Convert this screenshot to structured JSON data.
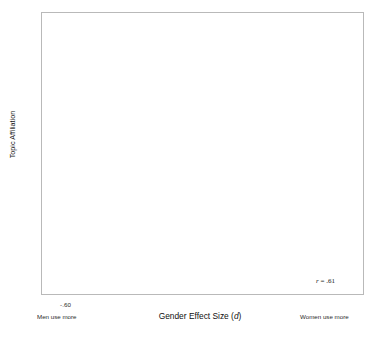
{
  "chart_data": {
    "type": "scatter",
    "title": "",
    "xlabel": "Gender Effect Size (d)",
    "ylabel": "Topic Affiliation",
    "xlim": [
      -0.72,
      0.86
    ],
    "ylim": [
      -0.175,
      0.175
    ],
    "xticks": [
      "-.60",
      "-.40",
      "-.20",
      "0",
      ".20",
      ".40",
      ".60"
    ],
    "xtick_values": [
      -0.6,
      -0.4,
      -0.2,
      0,
      0.2,
      0.4,
      0.6
    ],
    "yticks": [
      ".15",
      ".10",
      ".05",
      "0",
      "-.05",
      "-.10",
      "-.15"
    ],
    "ytick_values": [
      0.15,
      0.1,
      0.05,
      0,
      -0.05,
      -0.1,
      -0.15
    ],
    "grid": false,
    "legend": "none",
    "x_axis_low_label": "Men use more",
    "x_axis_high_label": "Women use more",
    "correlation_label": "r = .61",
    "correlation_value": 0.61,
    "n_points": 800,
    "marker": "open-circle",
    "fit_line": {
      "type": "linear-regression",
      "x_start": -0.47,
      "y_start": -0.052,
      "x_end": 0.68,
      "y_end": 0.069
    },
    "annotations": [
      {
        "id": "family-cluster",
        "lines": [
          "family, friends, wonderful,",
          "blessed, amazing, thankful,",
          "loving, husband, grateful, lucky"
        ],
        "text_x": 218,
        "text_y": 10,
        "leader": [
          [
            300,
            22
          ],
          [
            322,
            31
          ]
        ],
        "point": [
          0.505,
          0.156
        ]
      },
      {
        "id": "congrats-cluster",
        "lines": [
          "great, job, guys,",
          "amazing, crew, awesome,",
          "show, cast, proud, congrats"
        ],
        "text_x": 114,
        "text_y": 30,
        "leader": [
          [
            187,
            48
          ],
          [
            200,
            74
          ]
        ],
        "point": [
          -0.028,
          0.102
        ]
      },
      {
        "id": "sports-cluster",
        "lines": [
          "football, team, season,",
          "game, play, players,",
          "league, sports, fantasy"
        ],
        "text_x": 46,
        "text_y": 99,
        "leader": [
          [
            97,
            116
          ],
          [
            114,
            145
          ]
        ],
        "point": [
          -0.448,
          0.012
        ]
      },
      {
        "id": "politics-cluster",
        "lines": [
          "government,",
          "freedom,",
          "rights, country,",
          "thomas, political"
        ],
        "text_x": 43,
        "text_y": 196,
        "leader": [
          [
            98,
            203
          ],
          [
            122,
            208
          ]
        ],
        "point": [
          -0.404,
          -0.078
        ]
      },
      {
        "id": "profanity-cluster",
        "lines": [
          "shit, holy, fuck,",
          "fucking, piece, bull,",
          "loud, fuckin"
        ],
        "text_x": 62,
        "text_y": 270,
        "leader": [
          [
            96,
            269
          ],
          [
            96,
            245
          ]
        ],
        "point": [
          -0.452,
          -0.11
        ]
      },
      {
        "id": "negative-people-cluster",
        "lines": [
          "people, rude, selfish,",
          "stupid, ignorant, assholes,",
          "arrogant, they're"
        ],
        "text_x": 146,
        "text_y": 271,
        "leader": [
          [
            180,
            269
          ],
          [
            180,
            245
          ]
        ],
        "point": [
          -0.098,
          -0.11
        ]
      },
      {
        "id": "apathy-cluster",
        "lines": [
          "don't, care, anymore,",
          "honestly, pretend, act,",
          "bother, stare, else's, cared"
        ],
        "text_x": 213,
        "text_y": 218,
        "leader": [
          [
            212,
            216
          ],
          [
            199,
            203
          ]
        ],
        "point": [
          0.098,
          -0.05
        ]
      },
      {
        "id": "shopping-cluster",
        "lines": [
          "shopping, christmas, grocery,",
          "clothes, xmas, online,",
          "shoppin, spree, lunch, mall"
        ],
        "text_x": 277,
        "text_y": 186,
        "leader": [
          [
            300,
            184
          ],
          [
            300,
            152
          ]
        ],
        "point": [
          0.476,
          0.0
        ]
      }
    ]
  },
  "caption": {
    "faint_text": ""
  }
}
